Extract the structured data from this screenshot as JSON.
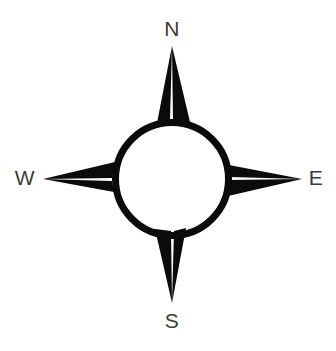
{
  "figure": {
    "background_color": "#ffffff",
    "ink_color": "#0b0b0b",
    "label_color": "#3a3a3a"
  },
  "compass": {
    "center": {
      "x": 172,
      "y": 179
    },
    "ring": {
      "outer_radius": 60,
      "inner_radius": 53,
      "stroke_width": 7
    },
    "labels": [
      {
        "id": "north",
        "text": "N",
        "x": 172,
        "y": 30
      },
      {
        "id": "east",
        "text": "E",
        "x": 316,
        "y": 179
      },
      {
        "id": "south",
        "text": "S",
        "x": 172,
        "y": 322
      },
      {
        "id": "west",
        "text": "W",
        "x": 25,
        "y": 179
      }
    ],
    "points": [
      {
        "id": "north",
        "direction": "N",
        "tip": {
          "x": 172,
          "y": 46
        },
        "light_limb": "M 172,46 L 157,123 L 170,120 Z",
        "dark_limb": "M 172,46 L 190,122 L 173,120 Z"
      },
      {
        "id": "east",
        "direction": "E",
        "tip": {
          "x": 302,
          "y": 179
        },
        "light_limb": "M 302,179 L 229,165 L 231,177 Z",
        "dark_limb": "M 302,179 L 228,196 L 231,180 Z"
      },
      {
        "id": "south",
        "direction": "S",
        "tip": {
          "x": 172,
          "y": 303
        },
        "light_limb": "M 172,303 L 186,228 L 174,231 Z",
        "dark_limb": "M 172,303 L 155,229 L 171,231 Z"
      },
      {
        "id": "west",
        "direction": "W",
        "tip": {
          "x": 43,
          "y": 179
        },
        "light_limb": "M 43,179 L 114,192 L 112,181 Z",
        "dark_limb": "M 43,179 L 115,162 L 112,178 Z"
      }
    ]
  }
}
